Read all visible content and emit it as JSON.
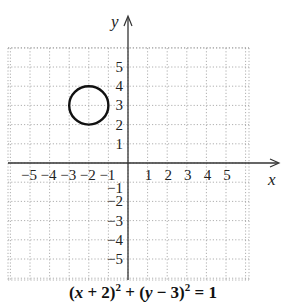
{
  "chart_data": {
    "type": "scatter",
    "title": "",
    "caption": "(x + 2)² + (y − 3)² = 1",
    "xlabel": "x",
    "ylabel": "y",
    "xlim": [
      -6,
      6
    ],
    "ylim": [
      -6,
      6
    ],
    "grid": true,
    "grid_style": "dotted",
    "x_ticks": [
      -5,
      -4,
      -3,
      -2,
      -1,
      1,
      2,
      3,
      4,
      5
    ],
    "y_ticks": [
      5,
      4,
      3,
      2,
      1,
      -1,
      -2,
      -3,
      -4,
      -5
    ],
    "x_tick_labels": [
      "−5",
      "−4",
      "−3",
      "−2",
      "−1",
      "1",
      "2",
      "3",
      "4",
      "5"
    ],
    "y_tick_labels": [
      "5",
      "4",
      "3",
      "2",
      "1",
      "−1",
      "−2",
      "−3",
      "−4",
      "−5"
    ],
    "shapes": [
      {
        "type": "circle",
        "center": [
          -2,
          3
        ],
        "radius": 1,
        "stroke": "#111111"
      }
    ],
    "legend": null
  },
  "equation": {
    "part1": "(",
    "var_x": "x",
    "part2": " + 2)",
    "exp1": "2",
    "part3": " + (",
    "var_y": "y",
    "part4": " − 3)",
    "exp2": "2",
    "part5": " = 1"
  },
  "labels": {
    "x_axis": "x",
    "y_axis": "y"
  },
  "colors": {
    "axis": "#333333",
    "grid": "#9a9a9a",
    "curve": "#111111"
  }
}
